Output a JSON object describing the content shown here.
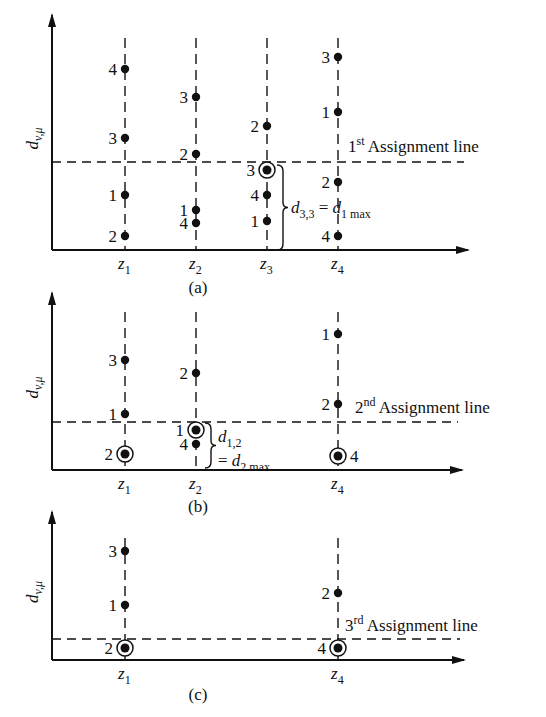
{
  "figure": {
    "y_axis_label": "d",
    "y_axis_label_sub": "v,μ",
    "colors": {
      "ink": "#111111",
      "background": "#ffffff"
    }
  },
  "panels": [
    {
      "id": "a",
      "caption": "(a)",
      "axis": {
        "x0": 52,
        "ytop": 15,
        "ybase": 250,
        "xend": 468
      },
      "columns": [
        {
          "name": "z",
          "sub": "1",
          "x": 125,
          "ytop": 38,
          "points": [
            {
              "label": "4",
              "y": 69
            },
            {
              "label": "3",
              "y": 138
            },
            {
              "label": "1",
              "y": 195
            },
            {
              "label": "2",
              "y": 236
            }
          ]
        },
        {
          "name": "z",
          "sub": "2",
          "x": 196,
          "ytop": 38,
          "points": [
            {
              "label": "3",
              "y": 97
            },
            {
              "label": "2",
              "y": 154
            },
            {
              "label": "1",
              "y": 210
            },
            {
              "label": "4",
              "y": 223
            }
          ]
        },
        {
          "name": "z",
          "sub": "3",
          "x": 267,
          "ytop": 38,
          "points": [
            {
              "label": "2",
              "y": 126
            },
            {
              "label": "3",
              "y": 170,
              "circled": true
            },
            {
              "label": "4",
              "y": 195
            },
            {
              "label": "1",
              "y": 221
            }
          ]
        },
        {
          "name": "z",
          "sub": "4",
          "x": 338,
          "ytop": 38,
          "points": [
            {
              "label": "3",
              "y": 57
            },
            {
              "label": "1",
              "y": 112
            },
            {
              "label": "2",
              "y": 182
            },
            {
              "label": "4",
              "y": 236
            }
          ]
        }
      ],
      "assignment_line": {
        "y": 162,
        "ordinal": "1",
        "suffix": "st",
        "text": "Assignment line"
      },
      "brace_note": {
        "d_sub": "3,3",
        "eq": "=",
        "rhs": "d",
        "rhs_sub": "1",
        "rhs_tail": "max"
      }
    },
    {
      "id": "b",
      "caption": "(b)",
      "axis": {
        "x0": 52,
        "ytop": 293,
        "ybase": 470,
        "xend": 462
      },
      "columns": [
        {
          "name": "z",
          "sub": "1",
          "x": 125,
          "ytop": 312,
          "points": [
            {
              "label": "3",
              "y": 360
            },
            {
              "label": "1",
              "y": 414
            },
            {
              "label": "2",
              "y": 454,
              "circled": true
            }
          ]
        },
        {
          "name": "z",
          "sub": "2",
          "x": 196,
          "ytop": 312,
          "points": [
            {
              "label": "2",
              "y": 373
            },
            {
              "label": "1",
              "y": 430,
              "circled": true
            },
            {
              "label": "4",
              "y": 444
            }
          ]
        },
        {
          "name": "z",
          "sub": "4",
          "x": 338,
          "ytop": 312,
          "points": [
            {
              "label": "1",
              "y": 334
            },
            {
              "label": "2",
              "y": 404
            },
            {
              "label": "4",
              "y": 456,
              "circled": true,
              "label_right": true
            }
          ]
        }
      ],
      "assignment_line": {
        "y": 422,
        "ordinal": "2",
        "suffix": "nd",
        "text": "Assignment line"
      },
      "brace_note": {
        "d_sub": "1,2",
        "eq": "=",
        "rhs": "d",
        "rhs_sub": "2",
        "rhs_tail": "max"
      }
    },
    {
      "id": "c",
      "caption": "(c)",
      "axis": {
        "x0": 52,
        "ytop": 512,
        "ybase": 660,
        "xend": 464
      },
      "columns": [
        {
          "name": "z",
          "sub": "1",
          "x": 125,
          "ytop": 538,
          "points": [
            {
              "label": "3",
              "y": 551
            },
            {
              "label": "1",
              "y": 605
            },
            {
              "label": "2",
              "y": 648,
              "circled": true
            }
          ]
        },
        {
          "name": "z",
          "sub": "4",
          "x": 338,
          "ytop": 538,
          "points": [
            {
              "label": "2",
              "y": 593
            },
            {
              "label": "4",
              "y": 648,
              "circled": true
            }
          ]
        }
      ],
      "assignment_line": {
        "y": 639,
        "ordinal": "3",
        "suffix": "rd",
        "text": "Assignment line"
      }
    }
  ]
}
